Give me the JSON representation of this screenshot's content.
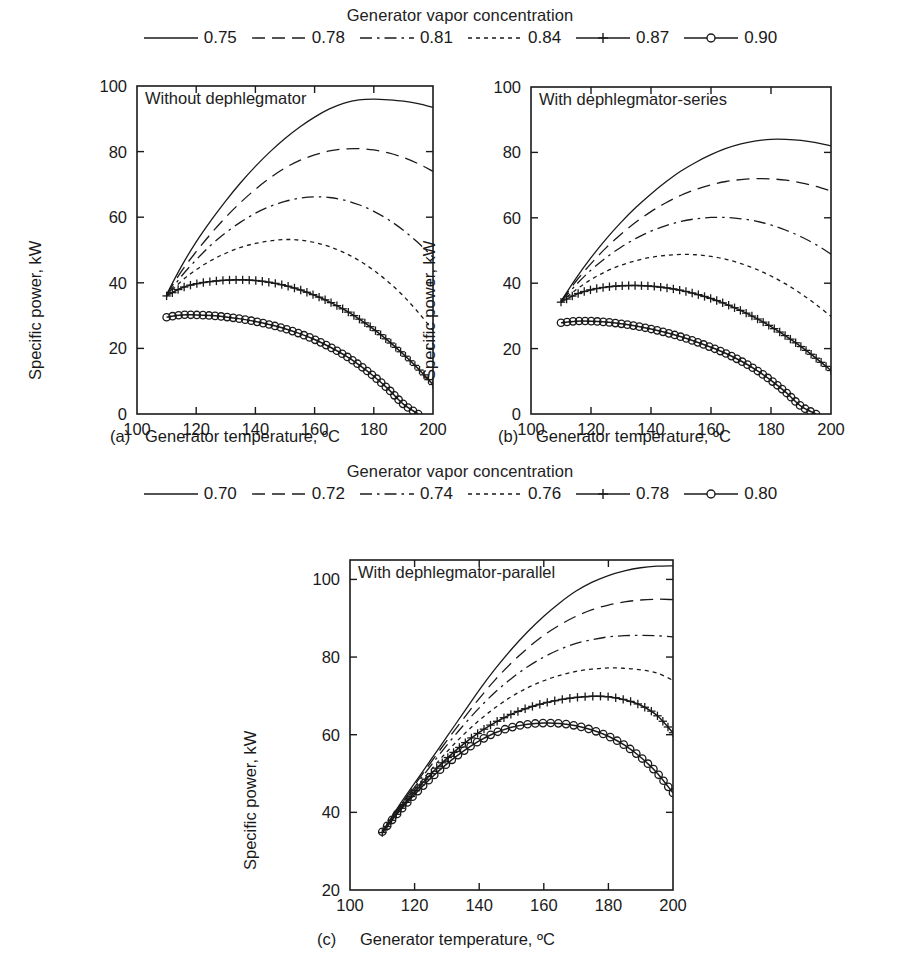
{
  "figure": {
    "width": 905,
    "height": 970,
    "background": "#ffffff",
    "line_color": "#1a1a1a"
  },
  "legends": [
    {
      "id": "legend-top",
      "title": "Generator vapor concentration",
      "entries": [
        {
          "label": "0.75",
          "style": "solid",
          "marker": "none"
        },
        {
          "label": "0.78",
          "style": "dashed",
          "marker": "none"
        },
        {
          "label": "0.81",
          "style": "dashdot",
          "marker": "none"
        },
        {
          "label": "0.84",
          "style": "dotted",
          "marker": "none"
        },
        {
          "label": "0.87",
          "style": "solid",
          "marker": "plus"
        },
        {
          "label": "0.90",
          "style": "solid",
          "marker": "circle"
        }
      ]
    },
    {
      "id": "legend-middle",
      "title": "Generator vapor concentration",
      "entries": [
        {
          "label": "0.70",
          "style": "solid",
          "marker": "none"
        },
        {
          "label": "0.72",
          "style": "dashed",
          "marker": "none"
        },
        {
          "label": "0.74",
          "style": "dashdot",
          "marker": "none"
        },
        {
          "label": "0.76",
          "style": "dotted",
          "marker": "none"
        },
        {
          "label": "0.78",
          "style": "solid",
          "marker": "plus"
        },
        {
          "label": "0.80",
          "style": "solid",
          "marker": "circle"
        }
      ]
    }
  ],
  "chart_data": [
    {
      "id": "chart-a",
      "type": "line",
      "tag": "(a)",
      "title": "Without dephlegmator",
      "xlabel": "Generator temperature, ºC",
      "ylabel": "Specific power, kW",
      "xlim": [
        100,
        200
      ],
      "ylim": [
        0,
        100
      ],
      "xticks": [
        100,
        120,
        140,
        160,
        180,
        200
      ],
      "yticks": [
        0,
        20,
        40,
        60,
        80,
        100
      ],
      "grid": false,
      "legend_ref": "legend-top",
      "x": [
        110,
        115,
        120,
        125,
        130,
        135,
        140,
        145,
        150,
        155,
        160,
        165,
        170,
        175,
        180,
        185,
        190,
        195,
        200
      ],
      "series": [
        {
          "name": "0.75",
          "style": "solid",
          "marker": "none",
          "values": [
            36.5,
            45.0,
            52.5,
            59.0,
            65.0,
            70.5,
            75.5,
            80.0,
            84.0,
            87.5,
            90.5,
            93.0,
            94.8,
            95.8,
            96.0,
            95.8,
            95.4,
            94.6,
            93.5
          ]
        },
        {
          "name": "0.78",
          "style": "dashed",
          "marker": "none",
          "values": [
            36.3,
            43.5,
            49.5,
            55.0,
            60.0,
            64.5,
            68.5,
            72.0,
            75.0,
            77.3,
            79.0,
            80.2,
            80.8,
            80.9,
            80.5,
            79.6,
            78.2,
            76.3,
            74.0
          ]
        },
        {
          "name": "0.81",
          "style": "dashdot",
          "marker": "none",
          "values": [
            36.0,
            42.0,
            47.0,
            51.5,
            55.3,
            58.5,
            61.2,
            63.3,
            64.8,
            65.8,
            66.2,
            66.0,
            65.2,
            63.8,
            61.8,
            59.2,
            56.0,
            52.2,
            47.8
          ]
        },
        {
          "name": "0.84",
          "style": "dotted",
          "marker": "none",
          "values": [
            36.0,
            40.5,
            44.0,
            46.8,
            49.0,
            50.8,
            52.0,
            52.8,
            53.2,
            53.0,
            52.3,
            51.0,
            49.2,
            46.8,
            43.8,
            40.2,
            36.0,
            31.0,
            25.5
          ]
        },
        {
          "name": "0.87",
          "style": "solid",
          "marker": "plus",
          "values": [
            36.0,
            38.4,
            39.7,
            40.4,
            40.8,
            40.9,
            40.7,
            40.1,
            39.2,
            37.9,
            36.2,
            34.2,
            31.8,
            29.0,
            25.8,
            22.2,
            18.2,
            13.8,
            9.0
          ]
        },
        {
          "name": "0.90",
          "style": "solid",
          "marker": "circle",
          "values": [
            29.5,
            30.2,
            30.2,
            30.0,
            29.6,
            29.0,
            28.2,
            27.2,
            26.0,
            24.5,
            22.7,
            20.5,
            18.0,
            15.0,
            11.5,
            7.5,
            3.0,
            0.0,
            0.0
          ]
        }
      ]
    },
    {
      "id": "chart-b",
      "type": "line",
      "tag": "(b)",
      "title": "With dephlegmator-series",
      "xlabel": "Generator temperature, ºC",
      "ylabel": "Specific power, kW",
      "xlim": [
        100,
        200
      ],
      "ylim": [
        0,
        100
      ],
      "xticks": [
        100,
        120,
        140,
        160,
        180,
        200
      ],
      "yticks": [
        0,
        20,
        40,
        60,
        80,
        100
      ],
      "grid": false,
      "legend_ref": "legend-top",
      "x": [
        110,
        115,
        120,
        125,
        130,
        135,
        140,
        145,
        150,
        155,
        160,
        165,
        170,
        175,
        180,
        185,
        190,
        195,
        200
      ],
      "series": [
        {
          "name": "0.75",
          "style": "solid",
          "marker": "none",
          "values": [
            34.5,
            41.5,
            47.8,
            53.5,
            58.6,
            63.2,
            67.3,
            71.0,
            74.3,
            77.0,
            79.3,
            81.2,
            82.6,
            83.5,
            84.0,
            84.0,
            83.7,
            83.0,
            82.0
          ]
        },
        {
          "name": "0.78",
          "style": "dashed",
          "marker": "none",
          "values": [
            34.4,
            40.6,
            46.0,
            50.8,
            55.0,
            58.7,
            61.9,
            64.6,
            66.9,
            68.7,
            70.1,
            71.1,
            71.7,
            72.0,
            71.9,
            71.5,
            70.7,
            69.6,
            68.2
          ]
        },
        {
          "name": "0.81",
          "style": "dashdot",
          "marker": "none",
          "values": [
            34.3,
            39.5,
            44.0,
            47.8,
            51.0,
            53.7,
            55.9,
            57.6,
            58.9,
            59.7,
            60.1,
            60.1,
            59.7,
            59.0,
            57.8,
            56.2,
            54.2,
            51.8,
            48.9
          ]
        },
        {
          "name": "0.84",
          "style": "dotted",
          "marker": "none",
          "values": [
            34.2,
            38.0,
            41.1,
            43.6,
            45.5,
            46.9,
            47.9,
            48.5,
            48.8,
            48.7,
            48.2,
            47.3,
            46.0,
            44.3,
            42.2,
            39.7,
            36.8,
            33.5,
            29.8
          ]
        },
        {
          "name": "0.87",
          "style": "solid",
          "marker": "plus",
          "values": [
            34.2,
            36.6,
            38.0,
            38.8,
            39.2,
            39.3,
            39.1,
            38.6,
            37.8,
            36.7,
            35.3,
            33.6,
            31.6,
            29.3,
            26.7,
            23.8,
            20.6,
            17.1,
            13.3
          ]
        },
        {
          "name": "0.90",
          "style": "solid",
          "marker": "circle",
          "values": [
            27.9,
            28.4,
            28.4,
            28.1,
            27.6,
            26.9,
            26.0,
            24.9,
            23.6,
            22.1,
            20.4,
            18.5,
            16.2,
            13.5,
            10.3,
            6.6,
            2.4,
            0.0,
            0.0
          ]
        }
      ]
    },
    {
      "id": "chart-c",
      "type": "line",
      "tag": "(c)",
      "title": "With dephlegmator-parallel",
      "xlabel": "Generator temperature, ºC",
      "ylabel": "Specific power, kW",
      "xlim": [
        100,
        200
      ],
      "ylim": [
        20,
        105
      ],
      "xticks": [
        100,
        120,
        140,
        160,
        180,
        200
      ],
      "yticks": [
        20,
        40,
        60,
        80,
        100
      ],
      "grid": false,
      "legend_ref": "legend-middle",
      "x": [
        110,
        115,
        120,
        125,
        130,
        135,
        140,
        145,
        150,
        155,
        160,
        165,
        170,
        175,
        180,
        185,
        190,
        195,
        200
      ],
      "series": [
        {
          "name": "0.70",
          "style": "solid",
          "marker": "none",
          "values": [
            35.0,
            41.5,
            47.5,
            53.5,
            59.5,
            65.5,
            71.5,
            77.0,
            82.0,
            86.5,
            90.5,
            94.0,
            97.0,
            99.3,
            101.0,
            102.2,
            103.0,
            103.4,
            103.5
          ]
        },
        {
          "name": "0.72",
          "style": "dashed",
          "marker": "none",
          "values": [
            34.8,
            41.0,
            47.0,
            52.8,
            58.5,
            64.0,
            69.3,
            74.2,
            78.5,
            82.3,
            85.6,
            88.3,
            90.5,
            92.2,
            93.4,
            94.2,
            94.7,
            94.9,
            94.8
          ]
        },
        {
          "name": "0.74",
          "style": "dashdot",
          "marker": "none",
          "values": [
            34.7,
            40.7,
            46.5,
            52.0,
            57.3,
            62.3,
            66.9,
            71.0,
            74.5,
            77.5,
            80.0,
            82.0,
            83.5,
            84.5,
            85.2,
            85.5,
            85.6,
            85.5,
            85.2
          ]
        },
        {
          "name": "0.76",
          "style": "dotted",
          "marker": "none",
          "values": [
            34.6,
            40.3,
            45.8,
            50.9,
            55.6,
            59.9,
            63.7,
            67.0,
            69.8,
            72.1,
            73.9,
            75.3,
            76.3,
            76.9,
            77.2,
            77.1,
            76.7,
            75.9,
            74.0
          ]
        },
        {
          "name": "0.78",
          "style": "solid",
          "marker": "plus",
          "values": [
            34.8,
            40.2,
            45.2,
            49.8,
            53.9,
            57.5,
            60.6,
            63.2,
            65.3,
            66.9,
            68.1,
            69.0,
            69.6,
            69.9,
            69.8,
            69.0,
            67.6,
            65.0,
            60.5
          ]
        },
        {
          "name": "0.80",
          "style": "solid",
          "marker": "circle",
          "values": [
            35.0,
            40.0,
            44.6,
            48.8,
            52.5,
            55.7,
            58.4,
            60.5,
            61.9,
            62.7,
            63.0,
            62.9,
            62.3,
            61.2,
            59.6,
            57.3,
            54.2,
            50.2,
            45.0
          ]
        }
      ]
    }
  ]
}
